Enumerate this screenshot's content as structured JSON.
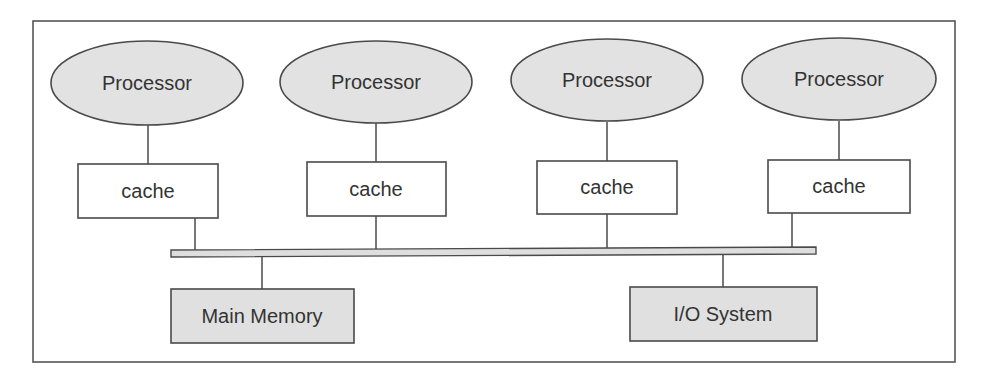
{
  "diagram": {
    "type": "shared-memory multiprocessor architecture",
    "processors": [
      {
        "label": "Processor",
        "cache_label": "cache"
      },
      {
        "label": "Processor",
        "cache_label": "cache"
      },
      {
        "label": "Processor",
        "cache_label": "cache"
      },
      {
        "label": "Processor",
        "cache_label": "cache"
      }
    ],
    "bus": {
      "label": ""
    },
    "main_memory": {
      "label": "Main Memory"
    },
    "io_system": {
      "label": "I/O System"
    },
    "colors": {
      "processor_fill": "#e2e2e2",
      "cache_fill": "#ffffff",
      "memory_fill": "#e0e0e0",
      "stroke": "#4a4a4a",
      "text": "#333333"
    }
  }
}
